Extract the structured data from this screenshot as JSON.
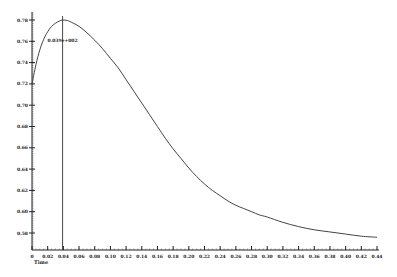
{
  "chart_data": {
    "type": "line",
    "title": "",
    "xlabel": "Time",
    "ylabel": "",
    "xlim": [
      0,
      0.44
    ],
    "ylim": [
      0.565,
      0.785
    ],
    "grid": false,
    "legend": "none",
    "x_ticks": [
      "0",
      "0.02",
      "0.04",
      "0.06",
      "0.08",
      "0.10",
      "0.12",
      "0.14",
      "0.16",
      "0.18",
      "0.20",
      "0.22",
      "0.24",
      "0.26",
      "0.28",
      "0.30",
      "0.32",
      "0.34",
      "0.36",
      "0.38",
      "0.40",
      "0.42",
      "0.44"
    ],
    "x_tick_values": [
      0,
      0.02,
      0.04,
      0.06,
      0.08,
      0.1,
      0.12,
      0.14,
      0.16,
      0.18,
      0.2,
      0.22,
      0.24,
      0.26,
      0.28,
      0.3,
      0.32,
      0.34,
      0.36,
      0.38,
      0.4,
      0.42,
      0.44
    ],
    "y_ticks": [
      "0.58",
      "0.60",
      "0.62",
      "0.64",
      "0.66",
      "0.68",
      "0.70",
      "0.72",
      "0.74",
      "0.76",
      "0.78"
    ],
    "y_tick_values": [
      0.58,
      0.6,
      0.62,
      0.64,
      0.66,
      0.68,
      0.7,
      0.72,
      0.74,
      0.76,
      0.78
    ],
    "series": [
      {
        "name": "signal",
        "color": "#444444",
        "x": [
          0,
          0.005,
          0.01,
          0.015,
          0.02,
          0.025,
          0.03,
          0.035,
          0.039,
          0.045,
          0.05,
          0.06,
          0.07,
          0.08,
          0.09,
          0.1,
          0.11,
          0.12,
          0.13,
          0.14,
          0.15,
          0.16,
          0.17,
          0.18,
          0.19,
          0.2,
          0.21,
          0.22,
          0.23,
          0.24,
          0.25,
          0.26,
          0.27,
          0.28,
          0.29,
          0.3,
          0.32,
          0.34,
          0.36,
          0.38,
          0.4,
          0.42,
          0.44
        ],
        "y": [
          0.72,
          0.738,
          0.752,
          0.762,
          0.769,
          0.774,
          0.777,
          0.779,
          0.78,
          0.7795,
          0.778,
          0.774,
          0.768,
          0.761,
          0.753,
          0.744,
          0.735,
          0.724,
          0.713,
          0.702,
          0.691,
          0.68,
          0.669,
          0.659,
          0.65,
          0.641,
          0.633,
          0.626,
          0.62,
          0.615,
          0.61,
          0.606,
          0.603,
          0.6,
          0.597,
          0.595,
          0.59,
          0.586,
          0.583,
          0.581,
          0.579,
          0.577,
          0.576
        ]
      }
    ],
    "annotations": [
      {
        "type": "vline",
        "x": 0.039,
        "label": "0.039e+002",
        "label_y": 0.759
      }
    ]
  }
}
